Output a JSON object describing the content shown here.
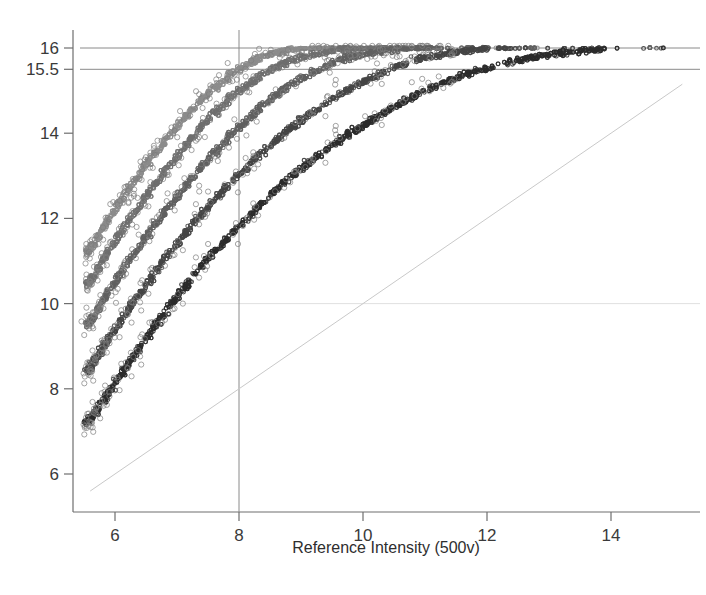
{
  "chart_data": {
    "type": "scatter",
    "title": "",
    "xlabel": "Reference Intensity (500v)",
    "ylabel": "",
    "xlim": [
      5.3,
      15.0
    ],
    "ylim": [
      5.5,
      16.2
    ],
    "xticks": [
      6,
      8,
      10,
      12,
      14
    ],
    "xticklabels": [
      "6",
      "8",
      "10",
      "12",
      "14"
    ],
    "yticks": [
      6,
      8,
      10,
      12,
      14,
      15.5,
      16
    ],
    "yticklabels": [
      "6",
      "8",
      "10",
      "12",
      "14",
      "15.5",
      "16"
    ],
    "grid": false,
    "legend": "none",
    "saturation_value": 16,
    "reference_lines": [
      {
        "name": "saturation-line",
        "orientation": "horizontal",
        "value": 16,
        "color": "#8a8a8a"
      },
      {
        "name": "upper-threshold-line",
        "orientation": "horizontal",
        "value": 15.5,
        "color": "#8a8a8a"
      },
      {
        "name": "mid-gridline",
        "orientation": "horizontal",
        "value": 10,
        "color": "#d8d8d8"
      },
      {
        "name": "reference-voltage-line",
        "orientation": "vertical",
        "value": 8,
        "color": "#8a8a8a"
      },
      {
        "name": "identity-line",
        "orientation": "diagonal",
        "slope": 1,
        "intercept": 0,
        "color": "#c9c9c9"
      }
    ],
    "series": [
      {
        "name": "series-1",
        "color": "#8c8c8c",
        "offset": 4.35,
        "knee": 1.45,
        "x": [
          5.55,
          5.8,
          6.05,
          6.3,
          6.55,
          6.8,
          7.05,
          7.3,
          7.55,
          7.8,
          8.05,
          8.3,
          8.55,
          8.8,
          9.05,
          9.3,
          9.6,
          10.0,
          10.5,
          11.0,
          11.6,
          12.2,
          12.8,
          13.4,
          14.0,
          14.6
        ],
        "y": [
          11.2,
          11.75,
          12.3,
          12.85,
          13.35,
          13.8,
          14.25,
          14.65,
          15.0,
          15.3,
          15.55,
          15.75,
          15.88,
          15.95,
          15.99,
          16.0,
          16.0,
          16.0,
          16.0,
          16.0,
          16.0,
          16.0,
          16.0,
          16.0,
          16.0,
          16.0
        ]
      },
      {
        "name": "series-2",
        "color": "#6e6e6e",
        "offset": 3.55,
        "knee": 1.45,
        "x": [
          5.55,
          5.8,
          6.05,
          6.3,
          6.55,
          6.8,
          7.05,
          7.3,
          7.55,
          7.8,
          8.05,
          8.3,
          8.55,
          8.8,
          9.05,
          9.3,
          9.6,
          10.0,
          10.5,
          11.0,
          11.6,
          12.2,
          12.8,
          13.4,
          14.0,
          14.6
        ],
        "y": [
          10.45,
          11.0,
          11.55,
          12.1,
          12.6,
          13.1,
          13.55,
          14.0,
          14.4,
          14.75,
          15.05,
          15.3,
          15.52,
          15.68,
          15.8,
          15.88,
          15.95,
          15.99,
          16.0,
          16.0,
          16.0,
          16.0,
          16.0,
          16.0,
          16.0,
          16.0
        ]
      },
      {
        "name": "series-3",
        "color": "#606060",
        "offset": 2.6,
        "knee": 1.45,
        "x": [
          5.55,
          5.8,
          6.05,
          6.3,
          6.55,
          6.8,
          7.05,
          7.3,
          7.55,
          7.8,
          8.05,
          8.3,
          8.55,
          8.8,
          9.05,
          9.3,
          9.6,
          10.0,
          10.5,
          11.0,
          11.6,
          12.2,
          12.8,
          13.4,
          14.0,
          14.6
        ],
        "y": [
          9.5,
          10.05,
          10.6,
          11.15,
          11.65,
          12.15,
          12.6,
          13.05,
          13.45,
          13.85,
          14.2,
          14.55,
          14.85,
          15.1,
          15.32,
          15.5,
          15.7,
          15.86,
          15.96,
          16.0,
          16.0,
          16.0,
          16.0,
          16.0,
          16.0,
          16.0
        ]
      },
      {
        "name": "series-4",
        "color": "#454545",
        "offset": 1.55,
        "knee": 1.45,
        "x": [
          5.55,
          5.8,
          6.05,
          6.3,
          6.55,
          6.8,
          7.05,
          7.3,
          7.55,
          7.8,
          8.05,
          8.3,
          8.55,
          8.8,
          9.05,
          9.3,
          9.6,
          10.0,
          10.5,
          11.0,
          11.6,
          12.2,
          12.8,
          13.4,
          14.0,
          14.6
        ],
        "y": [
          8.4,
          8.95,
          9.5,
          10.05,
          10.55,
          11.05,
          11.5,
          11.95,
          12.35,
          12.75,
          13.1,
          13.45,
          13.78,
          14.08,
          14.35,
          14.6,
          14.9,
          15.2,
          15.55,
          15.78,
          15.93,
          15.99,
          16.0,
          16.0,
          16.0,
          16.0
        ]
      },
      {
        "name": "series-5",
        "color": "#2b2b2b",
        "offset": 0.6,
        "knee": 1.45,
        "x": [
          5.55,
          5.8,
          6.05,
          6.3,
          6.55,
          6.8,
          7.05,
          7.3,
          7.55,
          7.8,
          8.05,
          8.3,
          8.55,
          8.8,
          9.05,
          9.3,
          9.6,
          10.0,
          10.5,
          11.0,
          11.6,
          12.2,
          12.8,
          13.4,
          14.0,
          14.6
        ],
        "y": [
          7.2,
          7.72,
          8.25,
          8.78,
          9.28,
          9.78,
          10.25,
          10.7,
          11.12,
          11.52,
          11.9,
          12.25,
          12.6,
          12.92,
          13.22,
          13.5,
          13.82,
          14.18,
          14.62,
          15.0,
          15.35,
          15.62,
          15.8,
          15.92,
          15.98,
          16.0
        ]
      }
    ]
  },
  "axes": {
    "x_axis_name": "Reference Intensity (500v)",
    "y_axis_name": ""
  }
}
